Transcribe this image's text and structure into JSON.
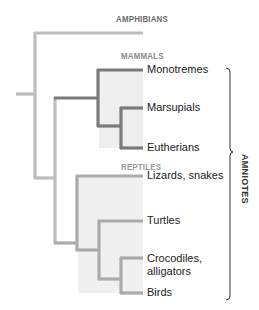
{
  "diagram": {
    "type": "phylogenetic-tree",
    "groups": {
      "amphibians": "AMPHIBIANS",
      "mammals": "MAMMALS",
      "reptiles": "REPTILES"
    },
    "taxa": [
      {
        "id": "monotremes",
        "label": "Monotremes",
        "group": "mammals"
      },
      {
        "id": "marsupials",
        "label": "Marsupials",
        "group": "mammals"
      },
      {
        "id": "eutherians",
        "label": "Eutherians",
        "group": "mammals"
      },
      {
        "id": "lizards",
        "label": "Lizards, snakes",
        "group": "reptiles"
      },
      {
        "id": "turtles",
        "label": "Turtles",
        "group": "reptiles"
      },
      {
        "id": "crocodiles",
        "label_line1": "Crocodiles,",
        "label_line2": "alligators",
        "group": "reptiles"
      },
      {
        "id": "birds",
        "label": "Birds",
        "group": "reptiles"
      }
    ],
    "bracket_label": "AMNIOTES",
    "colors": {
      "base_branch": "#bdbdbd",
      "mammal_branch": "#7a7a7a",
      "reptile_branch": "#ababab",
      "clade_fill": "#eeeeee",
      "group_label": "#8a8a8a",
      "amphibian_label": "#6b6b6b",
      "bracket": "#333333"
    }
  }
}
